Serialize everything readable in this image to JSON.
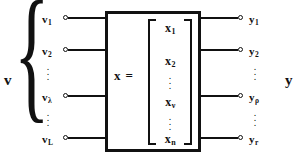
{
  "figure": {
    "colors": {
      "ink": "#111111",
      "background": "#ffffff"
    }
  },
  "input_group": {
    "label": "v",
    "brace": "{",
    "ports": [
      {
        "name": "v",
        "sub": "1"
      },
      {
        "name": "v",
        "sub": "2"
      },
      {
        "name": "v",
        "sub": "λ"
      },
      {
        "name": "v",
        "sub": "L"
      }
    ],
    "ellipsis": "⋮"
  },
  "system": {
    "equation_symbol": "x",
    "equation_operator": "=",
    "bracket_left": "[",
    "bracket_right": "]",
    "vector_elements": [
      {
        "name": "x",
        "sub": "1"
      },
      {
        "name": "x",
        "sub": "2"
      },
      {
        "name": "x",
        "sub": "ν"
      },
      {
        "name": "x",
        "sub": "n"
      }
    ],
    "ellipsis": "⋮"
  },
  "output_group": {
    "label": "y",
    "brace": "}",
    "ports": [
      {
        "name": "y",
        "sub": "1"
      },
      {
        "name": "y",
        "sub": "2"
      },
      {
        "name": "y",
        "sub": "ρ"
      },
      {
        "name": "y",
        "sub": "r"
      }
    ],
    "ellipsis": "⋮"
  }
}
